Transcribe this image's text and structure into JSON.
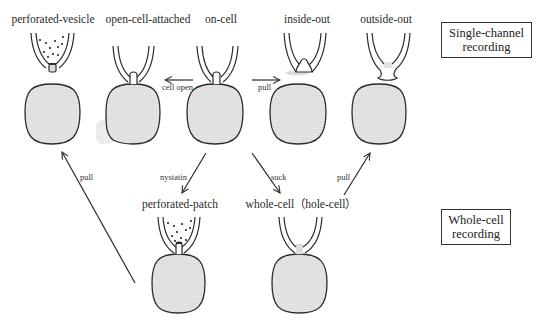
{
  "colors": {
    "line": "#2b2b2b",
    "cell_fill": "#e4e4e4",
    "pipette_fill": "#ffffff",
    "bleb_fill": "#d0d0d0",
    "background": "#ffffff"
  },
  "configurations": {
    "perforated_vesicle": "perforated-vesicle",
    "open_cell_attached": "open-cell-attached",
    "on_cell": "on-cell",
    "inside_out": "inside-out",
    "outside_out": "outside-out",
    "perforated_patch": "perforated-patch",
    "whole_cell": "whole-cell（hole-cell）"
  },
  "transitions": {
    "cell_open": "cell open",
    "pull_top": "pull",
    "nystatin": "nystatin",
    "suck": "suck",
    "pull_right": "pull",
    "pull_left": "pull"
  },
  "categories": {
    "single_channel_line1": "Single-channel",
    "single_channel_line2": "recording",
    "whole_cell_line1": "Whole-cell",
    "whole_cell_line2": "recording"
  }
}
